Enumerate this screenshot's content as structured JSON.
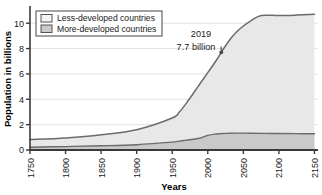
{
  "chart_data": {
    "type": "area",
    "title": "",
    "xlabel": "Years",
    "ylabel": "Population in billions",
    "xlim": [
      1750,
      2155
    ],
    "ylim": [
      0,
      11.2
    ],
    "grid": "horizontal",
    "stacked": true,
    "legend_position": "top-left",
    "x": [
      1750,
      1800,
      1850,
      1900,
      1950,
      1960,
      1970,
      1980,
      1990,
      2000,
      2010,
      2019,
      2020,
      2030,
      2040,
      2050,
      2060,
      2075,
      2100,
      2125,
      2150
    ],
    "xticks": [
      "1750",
      "1800",
      "1850",
      "1900",
      "1950",
      "2000",
      "2050",
      "2100",
      "2150"
    ],
    "xtick_values": [
      1750,
      1800,
      1850,
      1900,
      1950,
      2000,
      2050,
      2100,
      2150
    ],
    "yticks": [
      "0",
      "2",
      "4",
      "6",
      "8",
      "10"
    ],
    "ytick_values": [
      0,
      2,
      4,
      6,
      8,
      10
    ],
    "series": [
      {
        "name": "More-developed countries",
        "color": "#c9c9c9",
        "line_color": "#6b6b6b",
        "values": [
          0.22,
          0.27,
          0.33,
          0.42,
          0.62,
          0.7,
          0.78,
          0.85,
          0.95,
          1.15,
          1.25,
          1.29,
          1.3,
          1.32,
          1.33,
          1.33,
          1.32,
          1.31,
          1.3,
          1.29,
          1.28
        ]
      },
      {
        "name": "Less-developed countries",
        "color": "#e6e6e6",
        "line_color": "#6b6b6b",
        "values": [
          0.6,
          0.68,
          0.87,
          1.18,
          1.9,
          2.3,
          2.92,
          3.65,
          4.35,
          4.95,
          5.65,
          6.41,
          6.5,
          7.3,
          7.95,
          8.45,
          8.85,
          9.3,
          9.3,
          9.35,
          9.42
        ]
      }
    ],
    "total_line": {
      "name": "Total world population",
      "color": "#6b6b6b",
      "values": [
        0.82,
        0.95,
        1.2,
        1.6,
        2.52,
        3.0,
        3.7,
        4.5,
        5.3,
        6.1,
        6.9,
        7.7,
        7.8,
        8.62,
        9.28,
        9.78,
        10.17,
        10.61,
        10.6,
        10.64,
        10.7
      ]
    },
    "annotations": [
      {
        "name": "2019-population-annotation",
        "line1": "2019",
        "line2": "7.7 billion",
        "point_x": 2019,
        "point_y": 7.7
      }
    ]
  },
  "legend": {
    "items": [
      {
        "label": "Less-developed countries",
        "swatch": "#f2f2f2"
      },
      {
        "label": "More-developed countries",
        "swatch": "#c9c9c9"
      }
    ]
  },
  "colors": {
    "axis": "#3a3a3a",
    "gridline": "#dedede",
    "curve": "#6b6b6b",
    "less_developed_fill": "#e8e8e8",
    "more_developed_fill": "#c9c9c9",
    "text": "#1a1a1a"
  }
}
